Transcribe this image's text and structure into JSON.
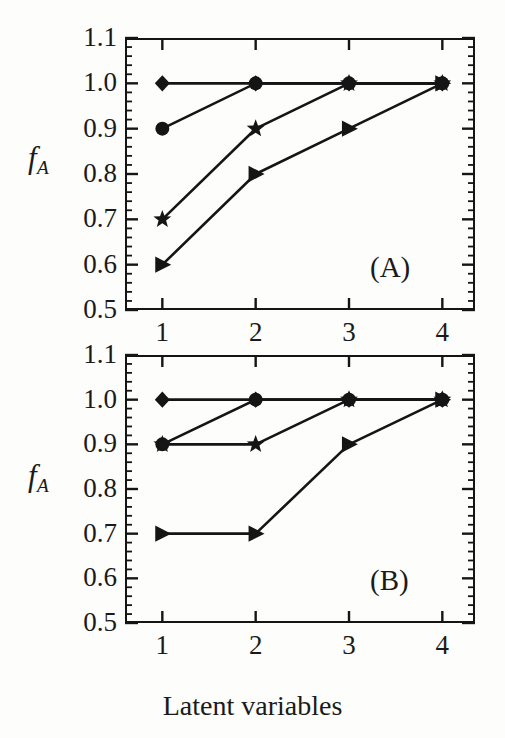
{
  "figure": {
    "background_color": "#fdfdfb",
    "ink_color": "#151515",
    "xlabel": "Latent variables"
  },
  "panel_a": {
    "tag": "(A)",
    "ylabel_main": "f",
    "ylabel_sub": "A",
    "ytick_labels": [
      "1.1",
      "1.0",
      "0.9",
      "0.8",
      "0.7",
      "0.6",
      "0.5"
    ],
    "xtick_labels": [
      "1",
      "2",
      "3",
      "4"
    ]
  },
  "panel_b": {
    "tag": "(B)",
    "ylabel_main": "f",
    "ylabel_sub": "A",
    "ytick_labels": [
      "1.1",
      "1.0",
      "0.9",
      "0.8",
      "0.7",
      "0.6",
      "0.5"
    ],
    "xtick_labels": [
      "1",
      "2",
      "3",
      "4"
    ]
  },
  "chart_data": [
    {
      "type": "line",
      "panel": "(A)",
      "title": "",
      "xlabel": "Latent variables",
      "ylabel": "f_A",
      "x": [
        1,
        2,
        3,
        4
      ],
      "xlim": [
        0.6,
        4.35
      ],
      "ylim": [
        0.5,
        1.1
      ],
      "xticks": [
        1,
        2,
        3,
        4
      ],
      "yticks": [
        0.5,
        0.6,
        0.7,
        0.8,
        0.9,
        1.0,
        1.1
      ],
      "y_minor_tick_step": 0.02,
      "grid": false,
      "legend": "none",
      "series": [
        {
          "name": "diamond",
          "marker": "diamond",
          "values": [
            1.0,
            1.0,
            1.0,
            1.0
          ]
        },
        {
          "name": "circle",
          "marker": "circle",
          "values": [
            0.9,
            1.0,
            1.0,
            1.0
          ]
        },
        {
          "name": "star",
          "marker": "star",
          "values": [
            0.7,
            0.9,
            1.0,
            1.0
          ]
        },
        {
          "name": "triangle",
          "marker": "triangle-right",
          "values": [
            0.6,
            0.8,
            0.9,
            1.0
          ]
        }
      ]
    },
    {
      "type": "line",
      "panel": "(B)",
      "title": "",
      "xlabel": "Latent variables",
      "ylabel": "f_A",
      "x": [
        1,
        2,
        3,
        4
      ],
      "xlim": [
        0.6,
        4.35
      ],
      "ylim": [
        0.5,
        1.1
      ],
      "xticks": [
        1,
        2,
        3,
        4
      ],
      "yticks": [
        0.5,
        0.6,
        0.7,
        0.8,
        0.9,
        1.0,
        1.1
      ],
      "y_minor_tick_step": 0.02,
      "grid": false,
      "legend": "none",
      "series": [
        {
          "name": "diamond",
          "marker": "diamond",
          "values": [
            1.0,
            1.0,
            1.0,
            1.0
          ]
        },
        {
          "name": "circle",
          "marker": "circle",
          "values": [
            0.9,
            1.0,
            1.0,
            1.0
          ]
        },
        {
          "name": "star",
          "marker": "star",
          "values": [
            0.9,
            0.9,
            1.0,
            1.0
          ]
        },
        {
          "name": "triangle",
          "marker": "triangle-right",
          "values": [
            0.7,
            0.7,
            0.9,
            1.0
          ]
        }
      ]
    }
  ]
}
